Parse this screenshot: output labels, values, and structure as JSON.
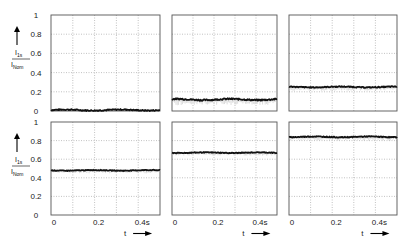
{
  "chart_data": {
    "type": "line",
    "title": "",
    "layout": {
      "rows": 2,
      "cols": 3,
      "grid": true,
      "grid_style": "dotted"
    },
    "xlabel": "t",
    "xlabel_arrow": "→",
    "ylabel_numerator": "I1s",
    "ylabel_denominator": "Inom",
    "ylabel_arrow": "↑",
    "xlim": [
      0,
      0.5
    ],
    "ylim": [
      0,
      1
    ],
    "x_ticks": [
      "0",
      "0.2",
      "0.4s"
    ],
    "x_tick_values": [
      0,
      0.2,
      0.4
    ],
    "x_grid_values": [
      0,
      0.1,
      0.2,
      0.3,
      0.4,
      0.5
    ],
    "y_ticks": [
      "0",
      "0.2",
      "0.4",
      "0.6",
      "0.8",
      "1"
    ],
    "y_tick_values": [
      0,
      0.2,
      0.4,
      0.6,
      0.8,
      1.0
    ],
    "panels": [
      {
        "row": 0,
        "col": 0,
        "level": 0.01,
        "noise": 0.012
      },
      {
        "row": 0,
        "col": 1,
        "level": 0.12,
        "noise": 0.015
      },
      {
        "row": 0,
        "col": 2,
        "level": 0.25,
        "noise": 0.01
      },
      {
        "row": 1,
        "col": 0,
        "level": 0.48,
        "noise": 0.008
      },
      {
        "row": 1,
        "col": 1,
        "level": 0.67,
        "noise": 0.008
      },
      {
        "row": 1,
        "col": 2,
        "level": 0.84,
        "noise": 0.01
      }
    ]
  },
  "geometry": {
    "col_x": [
      [
        51,
        160
      ],
      [
        172,
        277
      ],
      [
        289,
        397
      ]
    ],
    "row_y": [
      [
        15,
        111
      ],
      [
        122,
        215
      ]
    ]
  }
}
